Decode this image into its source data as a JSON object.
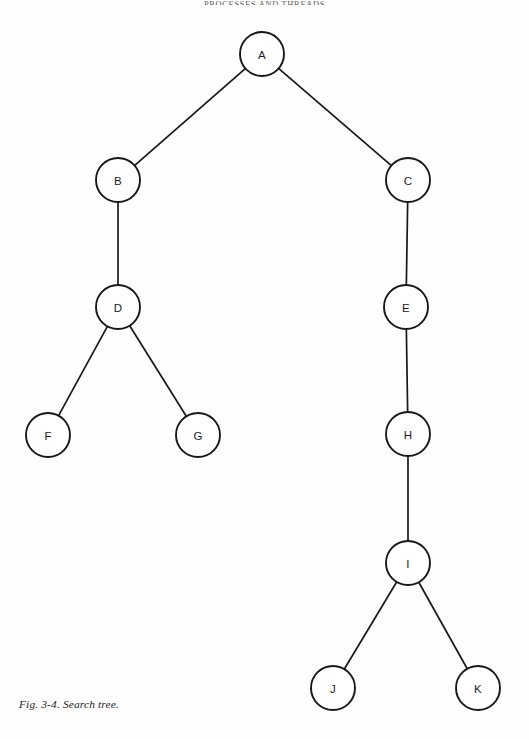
{
  "page": {
    "width": 529,
    "height": 739,
    "background_color": "#fefefe",
    "ink_color": "#18181b"
  },
  "running_header": {
    "text": "PROCESSES AND THREADS",
    "note": "clipped at top edge of page"
  },
  "caption": {
    "text": "Fig. 3-4. Search tree."
  },
  "chart_data": {
    "type": "diagram",
    "subtype": "tree",
    "title": "Search tree",
    "figure_number": "3-4",
    "node_radius": 22,
    "nodes": [
      {
        "id": "A",
        "label": "A",
        "x": 262,
        "y": 54,
        "depth": 0
      },
      {
        "id": "B",
        "label": "B",
        "x": 118,
        "y": 180,
        "depth": 1
      },
      {
        "id": "C",
        "label": "C",
        "x": 408,
        "y": 180,
        "depth": 1
      },
      {
        "id": "D",
        "label": "D",
        "x": 118,
        "y": 307,
        "depth": 2
      },
      {
        "id": "E",
        "label": "E",
        "x": 406,
        "y": 307,
        "depth": 2
      },
      {
        "id": "F",
        "label": "F",
        "x": 48,
        "y": 435,
        "depth": 3
      },
      {
        "id": "G",
        "label": "G",
        "x": 198,
        "y": 435,
        "depth": 3
      },
      {
        "id": "H",
        "label": "H",
        "x": 408,
        "y": 434,
        "depth": 3
      },
      {
        "id": "I",
        "label": "I",
        "x": 408,
        "y": 563,
        "depth": 4
      },
      {
        "id": "J",
        "label": "J",
        "x": 333,
        "y": 688,
        "depth": 5
      },
      {
        "id": "K",
        "label": "K",
        "x": 478,
        "y": 688,
        "depth": 5
      }
    ],
    "edges": [
      {
        "from": "A",
        "to": "B"
      },
      {
        "from": "A",
        "to": "C"
      },
      {
        "from": "B",
        "to": "D"
      },
      {
        "from": "C",
        "to": "E"
      },
      {
        "from": "D",
        "to": "F"
      },
      {
        "from": "D",
        "to": "G"
      },
      {
        "from": "E",
        "to": "H"
      },
      {
        "from": "H",
        "to": "I"
      },
      {
        "from": "I",
        "to": "J"
      },
      {
        "from": "I",
        "to": "K"
      }
    ]
  }
}
